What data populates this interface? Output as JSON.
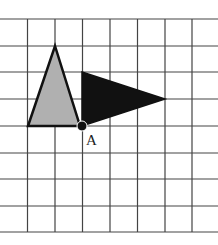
{
  "diagram": {
    "type": "grid-rotation",
    "grid": {
      "cell_size_px": 27.3,
      "columns": 8,
      "rows": 8,
      "line_color": "#444444"
    },
    "shapes": [
      {
        "name": "gray-triangle",
        "fill": "#b0b0b0",
        "stroke": "#111111",
        "points_grid": [
          [
            1,
            4
          ],
          [
            2,
            1
          ],
          [
            3,
            4
          ]
        ]
      },
      {
        "name": "black-triangle",
        "fill": "#111111",
        "stroke": "#111111",
        "points_grid": [
          [
            3,
            2
          ],
          [
            6,
            3
          ],
          [
            3,
            4
          ]
        ]
      }
    ],
    "point": {
      "label": "A",
      "grid": [
        3,
        4
      ]
    }
  }
}
